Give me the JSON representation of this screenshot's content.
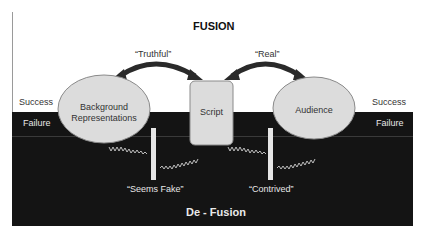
{
  "diagram": {
    "top_title": "FUSION",
    "bottom_title": "De - Fusion",
    "nodes": {
      "left": {
        "label_line1": "Background",
        "label_line2": "Representations"
      },
      "center": {
        "label": "Script"
      },
      "right": {
        "label": "Audience"
      }
    },
    "arrows": {
      "left": {
        "label": "“Truthful”"
      },
      "right": {
        "label": "“Real”"
      }
    },
    "breaks": {
      "left": {
        "label": "“Seems Fake”"
      },
      "right": {
        "label": "“Contrived”"
      }
    },
    "zones": {
      "left_success": "Success",
      "left_failure": "Failure",
      "right_success": "Success",
      "right_failure": "Failure"
    },
    "colors": {
      "background": "#ffffff",
      "defusion_region": "#141414",
      "node_fill": "#dcdcdc",
      "arrow": "#2a2a2a",
      "break_bar": "#e6e6e6"
    }
  }
}
